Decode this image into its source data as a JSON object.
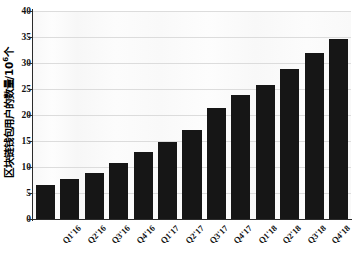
{
  "chart_data": {
    "type": "bar",
    "title": "",
    "subtitle": "",
    "xlabel": "",
    "ylabel": "区块链钱包用户的数量/10⁶个",
    "ylabel_text": "区块链钱包用户的数量/10",
    "ylabel_exponent": "6",
    "ylabel_unit": "个",
    "categories": [
      "Q1'16",
      "Q2'16",
      "Q3'16",
      "Q4'16",
      "Q1'17",
      "Q2'17",
      "Q3'17",
      "Q4'17",
      "Q1'18",
      "Q2'18",
      "Q3'18",
      "Q4'18",
      "Q1'19"
    ],
    "values": [
      6.5,
      7.6,
      8.8,
      10.8,
      12.8,
      14.8,
      17.1,
      21.4,
      23.8,
      25.7,
      28.8,
      31.9,
      34.6
    ],
    "ylim": [
      0,
      40
    ],
    "yticks": [
      0,
      5,
      10,
      15,
      20,
      25,
      30,
      35,
      40
    ],
    "ytick_labels": [
      "0",
      "5",
      "10",
      "15",
      "20",
      "25",
      "30",
      "35",
      "40"
    ],
    "grid": true,
    "grid_axis": "y",
    "legend": false,
    "legend_position": "none",
    "bar_color": "#161616",
    "grid_color": "#dcdcdc",
    "axis_color": "#2b2b2b",
    "plot_background": "#fbfbfb",
    "figure_background": "#ffffff",
    "xtick_rotation": -45,
    "bar_width_ratio": 0.78
  }
}
